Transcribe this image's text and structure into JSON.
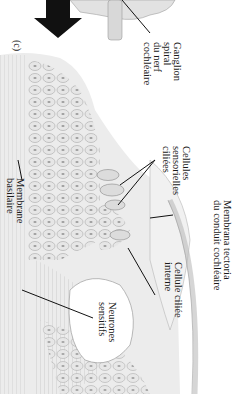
{
  "figure": {
    "panel_label": "(c)",
    "orientation": "rotated 90° clockwise",
    "labels": {
      "ganglion": [
        "Ganglion",
        "spiral",
        "du nerf",
        "cochléaire"
      ],
      "hair_cells": [
        "Cellules",
        "sensorielles",
        "ciliées"
      ],
      "tectorial": [
        "Membrana tectoria",
        "du conduit cochléaire"
      ],
      "inner_hair": [
        "Cellule ciliée",
        "interne"
      ],
      "neurons": [
        "Neurones",
        "sensitifs"
      ],
      "basilar": [
        "Membrane",
        "basilaire"
      ]
    },
    "colors": {
      "ink": "#1a1a1a",
      "tissue": "#cfcfcf",
      "tissue_dark": "#9a9a9a",
      "arrow": "#111111"
    }
  }
}
